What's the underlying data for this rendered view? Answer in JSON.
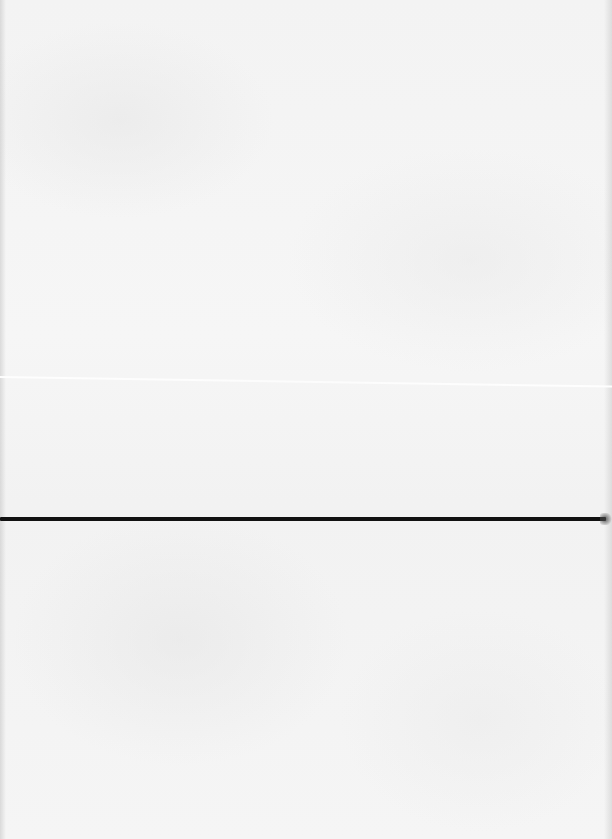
{
  "document": {
    "type": "scanned-blank-page",
    "text_content": [],
    "background_color": "#f4f4f4",
    "rule": {
      "color": "#111111",
      "y": 519,
      "thickness": 4,
      "span": "full-width"
    },
    "crease": {
      "y": 377,
      "color": "#ffffff"
    }
  }
}
